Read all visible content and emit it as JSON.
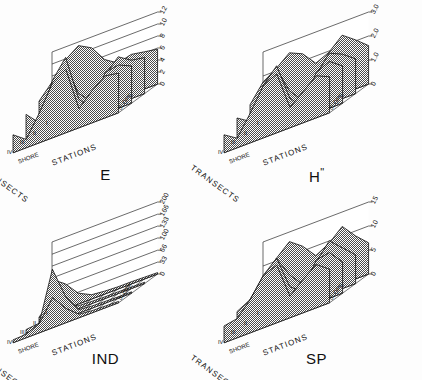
{
  "figure": {
    "background": "#ffffff",
    "ink": "#111111",
    "fill_style": "halftone-checker",
    "panel_count": 4
  },
  "axes_common": {
    "transect_axis_label": "TRANSECTS",
    "transect_ticks": [
      "I",
      "II",
      "III",
      "IV"
    ],
    "station_axis_label": "STATIONS",
    "station_start_label": "SHORE",
    "station_end_label": "SLOPE"
  },
  "chart_data": [
    {
      "type": "line",
      "title": "E",
      "panel": "top-left",
      "xlabel": "STATIONS",
      "ylabel": "",
      "zlabel": "TRANSECTS",
      "ylim": [
        0,
        12
      ],
      "yticks": [
        0,
        2,
        4,
        6,
        8,
        10,
        12
      ],
      "ytick_labels": [
        "0",
        "2",
        "4",
        "6",
        "8",
        "10",
        "12"
      ],
      "x": [
        "SHORE",
        "2",
        "3",
        "4",
        "5",
        "6",
        "7",
        "8",
        "SLOPE"
      ],
      "grid": true,
      "legend": "none",
      "series": [
        {
          "name": "I",
          "values": [
            6.2,
            9.8,
            11.4,
            10.2,
            7.4,
            6.0,
            6.6,
            6.2,
            5.8
          ]
        },
        {
          "name": "II",
          "values": [
            5.4,
            7.8,
            9.6,
            4.2,
            2.0,
            5.6,
            7.8,
            6.4,
            6.0
          ]
        },
        {
          "name": "III",
          "values": [
            4.8,
            2.6,
            8.8,
            11.8,
            4.0,
            1.6,
            6.8,
            7.2,
            6.2
          ]
        },
        {
          "name": "IV",
          "values": [
            3.0,
            1.4,
            5.0,
            9.2,
            10.6,
            3.2,
            5.4,
            7.0,
            6.6
          ]
        }
      ]
    },
    {
      "type": "line",
      "title": "H\"",
      "panel": "top-right",
      "xlabel": "STATIONS",
      "ylabel": "",
      "zlabel": "TRANSECTS",
      "ylim": [
        0,
        3.0
      ],
      "yticks": [
        0,
        1.0,
        2.0,
        3.0
      ],
      "ytick_labels": [
        "0",
        "1.0",
        "2.0",
        "3.0"
      ],
      "x": [
        "SHORE",
        "2",
        "3",
        "4",
        "5",
        "6",
        "7",
        "8",
        "SLOPE"
      ],
      "grid": true,
      "legend": "none",
      "series": [
        {
          "name": "I",
          "values": [
            1.35,
            2.1,
            2.55,
            2.3,
            1.7,
            1.95,
            2.45,
            2.05,
            1.6
          ]
        },
        {
          "name": "II",
          "values": [
            1.2,
            1.95,
            2.3,
            1.15,
            0.55,
            1.4,
            2.1,
            1.85,
            1.45
          ]
        },
        {
          "name": "III",
          "values": [
            1.05,
            0.7,
            2.0,
            2.6,
            1.05,
            0.45,
            1.7,
            1.95,
            1.55
          ]
        },
        {
          "name": "IV",
          "values": [
            0.75,
            0.4,
            1.25,
            2.2,
            2.45,
            0.85,
            1.3,
            1.75,
            1.5
          ]
        }
      ]
    },
    {
      "type": "line",
      "title": "IND",
      "panel": "bottom-left",
      "xlabel": "STATIONS",
      "ylabel": "",
      "zlabel": "TRANSECTS",
      "ylim": [
        0,
        200
      ],
      "yticks": [
        0,
        33,
        66,
        100,
        133,
        166,
        200
      ],
      "ytick_labels": [
        "0",
        "33",
        "66",
        "100",
        "133",
        "166",
        "200"
      ],
      "x": [
        "SHORE",
        "2",
        "3",
        "4",
        "5",
        "6",
        "7",
        "8",
        "SLOPE"
      ],
      "grid": true,
      "legend": "none",
      "series": [
        {
          "name": "I",
          "values": [
            96,
            70,
            30,
            12,
            8,
            6,
            6,
            5,
            4
          ]
        },
        {
          "name": "II",
          "values": [
            18,
            52,
            20,
            8,
            6,
            5,
            5,
            4,
            4
          ]
        },
        {
          "name": "III",
          "values": [
            10,
            14,
            150,
            60,
            10,
            6,
            5,
            4,
            4
          ]
        },
        {
          "name": "IV",
          "values": [
            8,
            10,
            26,
            84,
            40,
            10,
            6,
            5,
            4
          ]
        }
      ]
    },
    {
      "type": "line",
      "title": "SP",
      "panel": "bottom-right",
      "xlabel": "STATIONS",
      "ylabel": "",
      "zlabel": "TRANSECTS",
      "ylim": [
        0,
        15
      ],
      "yticks": [
        0,
        5,
        10,
        15
      ],
      "ytick_labels": [
        "0",
        "5",
        "10",
        "15"
      ],
      "x": [
        "SHORE",
        "2",
        "3",
        "4",
        "5",
        "6",
        "7",
        "8",
        "SLOPE"
      ],
      "grid": true,
      "legend": "none",
      "series": [
        {
          "name": "I",
          "values": [
            6.0,
            10.5,
            13.0,
            11.0,
            8.0,
            9.5,
            12.0,
            9.0,
            6.5
          ]
        },
        {
          "name": "II",
          "values": [
            5.0,
            8.5,
            11.5,
            7.0,
            4.0,
            7.5,
            11.0,
            8.5,
            6.0
          ]
        },
        {
          "name": "III",
          "values": [
            4.5,
            6.0,
            10.0,
            12.5,
            5.5,
            3.5,
            9.0,
            9.5,
            6.5
          ]
        },
        {
          "name": "IV",
          "values": [
            3.5,
            4.0,
            7.0,
            11.0,
            12.0,
            4.5,
            7.0,
            9.0,
            7.0
          ]
        }
      ]
    }
  ]
}
